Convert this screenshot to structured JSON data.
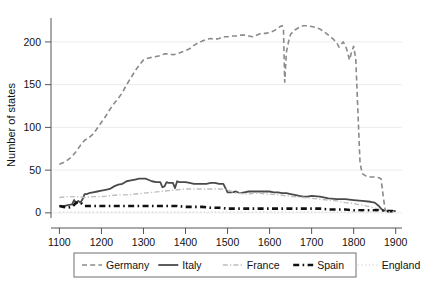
{
  "chart_data": {
    "type": "line",
    "title": "",
    "xlabel": "",
    "ylabel": "Number of states",
    "xlim": [
      1080,
      1915
    ],
    "ylim": [
      -6,
      228
    ],
    "xticks": [
      1100,
      1200,
      1300,
      1400,
      1500,
      1600,
      1700,
      1800,
      1900
    ],
    "yticks": [
      0,
      50,
      100,
      150,
      200
    ],
    "xtick_labels": [
      "1100",
      "1200",
      "1300",
      "1400",
      "1500",
      "1600",
      "1700",
      "1800",
      "1900"
    ],
    "ytick_labels": [
      "0",
      "50",
      "100",
      "150",
      "200"
    ],
    "grid": "horizontal",
    "legend_position": "below-outside",
    "series": [
      {
        "name": "Germany",
        "color": "#8a8a8a",
        "style": "dashed",
        "width": 1.6,
        "x": [
          1100,
          1110,
          1120,
          1130,
          1140,
          1150,
          1160,
          1170,
          1180,
          1190,
          1200,
          1210,
          1220,
          1230,
          1240,
          1250,
          1260,
          1270,
          1280,
          1290,
          1300,
          1310,
          1320,
          1330,
          1340,
          1350,
          1360,
          1370,
          1380,
          1390,
          1400,
          1410,
          1420,
          1430,
          1440,
          1450,
          1460,
          1470,
          1480,
          1490,
          1500,
          1510,
          1520,
          1530,
          1540,
          1550,
          1560,
          1570,
          1580,
          1590,
          1600,
          1610,
          1620,
          1625,
          1630,
          1633,
          1636,
          1640,
          1645,
          1650,
          1660,
          1670,
          1680,
          1690,
          1700,
          1710,
          1720,
          1730,
          1740,
          1750,
          1760,
          1765,
          1770,
          1775,
          1780,
          1785,
          1790,
          1795,
          1800,
          1805,
          1810,
          1815,
          1820,
          1830,
          1840,
          1850,
          1860,
          1865,
          1870,
          1875,
          1880,
          1890,
          1900
        ],
        "y": [
          57,
          59,
          62,
          66,
          72,
          79,
          85,
          88,
          92,
          99,
          106,
          113,
          121,
          128,
          134,
          141,
          150,
          158,
          166,
          173,
          179,
          181,
          182,
          183,
          184,
          186,
          186,
          185,
          186,
          188,
          190,
          192,
          196,
          199,
          201,
          203,
          204,
          203,
          204,
          206,
          206,
          207,
          207,
          208,
          208,
          207,
          206,
          208,
          210,
          210,
          211,
          213,
          216,
          218,
          219,
          215,
          153,
          188,
          200,
          209,
          214,
          217,
          219,
          219,
          218,
          217,
          215,
          212,
          208,
          204,
          199,
          194,
          197,
          200,
          196,
          189,
          179,
          188,
          195,
          180,
          120,
          60,
          46,
          43,
          42,
          42,
          41,
          40,
          21,
          3,
          2,
          2,
          2
        ]
      },
      {
        "name": "Italy",
        "color": "#4a4a4a",
        "style": "solid",
        "width": 1.8,
        "x": [
          1100,
          1110,
          1120,
          1130,
          1135,
          1140,
          1145,
          1150,
          1155,
          1160,
          1165,
          1170,
          1180,
          1190,
          1200,
          1210,
          1220,
          1230,
          1240,
          1250,
          1260,
          1270,
          1280,
          1290,
          1300,
          1305,
          1310,
          1320,
          1330,
          1340,
          1345,
          1350,
          1355,
          1360,
          1370,
          1375,
          1380,
          1385,
          1390,
          1400,
          1410,
          1420,
          1430,
          1440,
          1450,
          1460,
          1470,
          1480,
          1490,
          1495,
          1500,
          1510,
          1520,
          1530,
          1540,
          1550,
          1560,
          1570,
          1580,
          1590,
          1600,
          1610,
          1620,
          1630,
          1640,
          1650,
          1660,
          1670,
          1680,
          1690,
          1700,
          1720,
          1740,
          1760,
          1780,
          1800,
          1820,
          1840,
          1850,
          1860,
          1865,
          1870,
          1880,
          1890,
          1900
        ],
        "y": [
          8,
          8,
          9,
          10,
          15,
          11,
          14,
          12,
          16,
          22,
          22,
          23,
          24,
          25,
          26,
          27,
          28,
          31,
          33,
          34,
          37,
          38,
          39,
          40,
          40,
          40,
          39,
          37,
          36,
          36,
          30,
          31,
          36,
          35,
          35,
          29,
          37,
          36,
          36,
          36,
          35,
          34,
          34,
          34,
          34,
          35,
          35,
          34,
          34,
          29,
          24,
          24,
          25,
          23,
          24,
          25,
          25,
          25,
          25,
          25,
          25,
          24,
          24,
          23,
          23,
          22,
          21,
          20,
          19,
          19,
          20,
          19,
          17,
          16,
          16,
          15,
          14,
          13,
          12,
          8,
          5,
          3,
          2,
          2,
          2
        ]
      },
      {
        "name": "France",
        "color": "#bdbdbd",
        "style": "dashdot",
        "width": 1.4,
        "x": [
          1100,
          1120,
          1140,
          1160,
          1180,
          1200,
          1220,
          1240,
          1260,
          1280,
          1300,
          1320,
          1340,
          1360,
          1380,
          1400,
          1420,
          1440,
          1460,
          1480,
          1500,
          1510,
          1520,
          1530,
          1540,
          1550,
          1560,
          1570,
          1580,
          1590,
          1600,
          1620,
          1640,
          1660,
          1680,
          1700,
          1720,
          1740,
          1760,
          1780,
          1800,
          1820,
          1840,
          1860,
          1870,
          1880,
          1900
        ],
        "y": [
          18,
          19,
          19,
          18,
          19,
          19,
          20,
          21,
          21,
          22,
          23,
          24,
          25,
          26,
          27,
          28,
          28,
          28,
          28,
          28,
          27,
          25,
          23,
          23,
          22,
          22,
          23,
          23,
          23,
          22,
          22,
          21,
          20,
          19,
          18,
          17,
          16,
          15,
          14,
          12,
          11,
          9,
          7,
          4,
          2,
          2,
          2
        ]
      },
      {
        "name": "Spain",
        "color": "#111111",
        "style": "bold-dash",
        "width": 2.6,
        "x": [
          1100,
          1110,
          1120,
          1130,
          1140,
          1150,
          1160,
          1170,
          1180,
          1200,
          1220,
          1240,
          1260,
          1280,
          1300,
          1320,
          1340,
          1360,
          1380,
          1400,
          1420,
          1440,
          1460,
          1480,
          1500,
          1520,
          1540,
          1560,
          1580,
          1600,
          1620,
          1640,
          1660,
          1680,
          1700,
          1720,
          1740,
          1760,
          1780,
          1800,
          1820,
          1840,
          1860,
          1880,
          1900
        ],
        "y": [
          8,
          7,
          6,
          7,
          12,
          12,
          8,
          8,
          8,
          8,
          8,
          8,
          8,
          8,
          8,
          8,
          8,
          8,
          8,
          7,
          7,
          7,
          6,
          6,
          5,
          5,
          5,
          5,
          5,
          5,
          5,
          5,
          5,
          5,
          5,
          5,
          4,
          4,
          4,
          3,
          3,
          3,
          3,
          2,
          2
        ]
      },
      {
        "name": "England",
        "color": "#dcdcdc",
        "style": "dotted",
        "width": 1.4,
        "x": [
          1100,
          1150,
          1200,
          1250,
          1300,
          1350,
          1400,
          1450,
          1500,
          1550,
          1600,
          1650,
          1700,
          1750,
          1800,
          1850,
          1900
        ],
        "y": [
          1,
          1,
          1,
          1,
          1,
          1,
          1,
          1,
          1,
          1,
          1,
          1,
          1,
          1,
          1,
          1,
          1
        ]
      }
    ]
  },
  "legend": {
    "entries": [
      {
        "label": "Germany"
      },
      {
        "label": "Italy"
      },
      {
        "label": "France"
      },
      {
        "label": "Spain"
      },
      {
        "label": "England"
      }
    ]
  }
}
